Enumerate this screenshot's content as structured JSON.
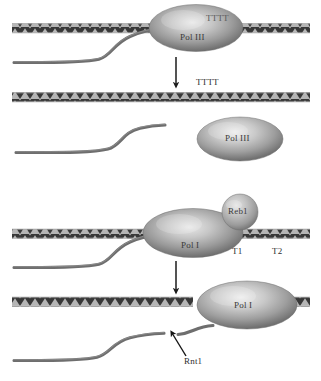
{
  "figure": {
    "background_color": "#ffffff",
    "dna_color": "#3a3a3a",
    "rna_color": "#6b6b6b",
    "protein_color": "#8e8e8e",
    "text_color": "#2f2f2f"
  },
  "panels": [
    {
      "id": "panel-1",
      "name": "pol3-terminating",
      "dna_label": "dna-duplex",
      "protein": {
        "name": "Pol III",
        "shape": "ellipse"
      },
      "signal_on_protein": "TTTT",
      "rna": "nascent-transcript"
    },
    {
      "id": "panel-2",
      "name": "pol3-released",
      "dna_label": "dna-duplex",
      "terminator_sequence": "TTTT",
      "protein": {
        "name": "Pol III",
        "shape": "ellipse"
      },
      "rna": "released-transcript"
    },
    {
      "id": "panel-3",
      "name": "pol1-paused-at-reb1",
      "dna_label": "dna-duplex",
      "protein": {
        "name": "Pol I",
        "shape": "ellipse"
      },
      "roadblock": {
        "name": "Reb1",
        "shape": "circle"
      },
      "sites": [
        "T1",
        "T2"
      ],
      "rna": "nascent-transcript"
    },
    {
      "id": "panel-4",
      "name": "pol1-rnt1-cleavage",
      "dna_label": "dna-duplex",
      "protein": {
        "name": "Pol I",
        "shape": "ellipse"
      },
      "endonuclease": {
        "name": "Rnt1"
      },
      "rna": "cleaved-transcript"
    }
  ],
  "labels": {
    "pol3_on_dna": "Pol III",
    "pol3_ttt_on_protein": "TTTT",
    "terminator_tttt": "TTTT",
    "pol3_free": "Pol III",
    "reb1": "Reb1",
    "pol1_paused": "Pol I",
    "t1": "T1",
    "t2": "T2",
    "pol1_cleaved": "Pol I",
    "rnt1": "Rnt1"
  },
  "arrows": [
    {
      "name": "arrow-panel1-to-panel2",
      "direction": "down"
    },
    {
      "name": "arrow-panel3-to-panel4",
      "direction": "down"
    },
    {
      "name": "arrow-rnt1-pointer",
      "direction": "up-left"
    }
  ]
}
